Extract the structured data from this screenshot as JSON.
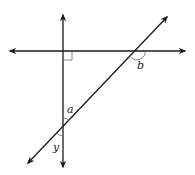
{
  "diagram": {
    "type": "geometry-lines",
    "colors": {
      "line": "#1a1a1a",
      "marker": "#777777",
      "background": "#ffffff"
    },
    "lines": {
      "vertical": {
        "x1": 63,
        "y1": 15,
        "x2": 63,
        "y2": 167
      },
      "horizontal": {
        "x1": 10,
        "y1": 51,
        "x2": 185,
        "y2": 51
      },
      "transversal": {
        "x1": 28,
        "y1": 163,
        "x2": 167,
        "y2": 17
      }
    },
    "right_angle": {
      "x": 63,
      "y": 51,
      "size": 9
    },
    "labels": {
      "a": "a",
      "b": "b",
      "y": "y"
    }
  }
}
